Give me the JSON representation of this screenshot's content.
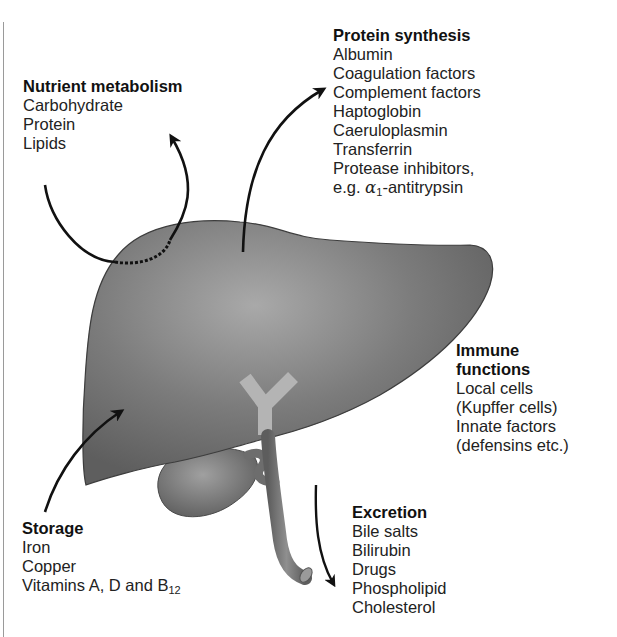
{
  "diagram": {
    "groups": {
      "nutrient": {
        "title": "Nutrient metabolism",
        "items": [
          "Carbohydrate",
          "Protein",
          "Lipids"
        ]
      },
      "protein": {
        "title": "Protein synthesis",
        "items": [
          "Albumin",
          "Coagulation factors",
          "Complement factors",
          "Haptoglobin",
          "Caeruloplasmin",
          "Transferrin",
          "Protease inhibitors,"
        ],
        "last_prefix": "e.g. ",
        "last_symbol": "α",
        "last_sub": "1",
        "last_suffix": "-antitrypsin"
      },
      "immune": {
        "title_line1": "Immune",
        "title_line2": "functions",
        "items": [
          "Local cells",
          "(Kupffer cells)",
          "Innate factors",
          "(defensins etc.)"
        ]
      },
      "storage": {
        "title": "Storage",
        "items": [
          "Iron",
          "Copper"
        ],
        "last_prefix": "Vitamins A, D and B",
        "last_sub": "12"
      },
      "excretion": {
        "title": "Excretion",
        "items": [
          "Bile salts",
          "Bilirubin",
          "Drugs",
          "Phospholipid",
          "Cholesterol"
        ]
      }
    },
    "colors": {
      "liver_dark": "#6b6b6b",
      "liver_light": "#a8a8a8",
      "bile_duct_y": "#b4b4b4",
      "arrow": "#111111"
    }
  }
}
